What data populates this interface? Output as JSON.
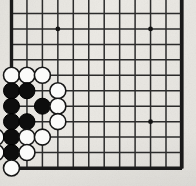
{
  "board": {
    "kind": "go-board",
    "view": "bottom-left corner crop of a 19x19 goban",
    "title": "Go board position",
    "geometry": {
      "cols": 12,
      "rows": 11,
      "origin_x": 11.5,
      "origin_y": 13.5,
      "spacing": 15.45,
      "edge_left_x": 11.5,
      "edge_bottom_y": 168.5,
      "edge_right_x": 182.0,
      "stone_radius": 8.0
    },
    "colors": {
      "paper": "#eceae5",
      "line": "#2b2b2b",
      "edge_line": "#1a1a1a",
      "black_stone": "#0d0d0d",
      "white_stone": "#fbfbfa",
      "white_stone_outline": "#161616",
      "star_point": "#141414"
    },
    "star_points": [
      {
        "col": 3,
        "row": 1
      },
      {
        "col": 9,
        "row": 1
      },
      {
        "col": 3,
        "row": 7
      },
      {
        "col": 9,
        "row": 7
      }
    ],
    "stones": [
      {
        "color": "white",
        "col": 0,
        "row": 4
      },
      {
        "color": "white",
        "col": 1,
        "row": 4
      },
      {
        "color": "white",
        "col": 2,
        "row": 4
      },
      {
        "color": "black",
        "col": 0,
        "row": 5
      },
      {
        "color": "black",
        "col": 1,
        "row": 5
      },
      {
        "color": "white",
        "col": 3,
        "row": 5
      },
      {
        "color": "black",
        "col": 0,
        "row": 6
      },
      {
        "color": "black",
        "col": 2,
        "row": 6
      },
      {
        "color": "white",
        "col": 3,
        "row": 6
      },
      {
        "color": "black",
        "col": 0,
        "row": 7
      },
      {
        "color": "black",
        "col": 1,
        "row": 7
      },
      {
        "color": "white",
        "col": 3,
        "row": 7
      },
      {
        "color": "white",
        "col": -1,
        "row": 8
      },
      {
        "color": "black",
        "col": 0,
        "row": 8
      },
      {
        "color": "white",
        "col": 1,
        "row": 8
      },
      {
        "color": "white",
        "col": 2,
        "row": 8
      },
      {
        "color": "white",
        "col": -1,
        "row": 9
      },
      {
        "color": "black",
        "col": 0,
        "row": 9
      },
      {
        "color": "white",
        "col": 1,
        "row": 9
      },
      {
        "color": "white",
        "col": 0,
        "row": 10
      }
    ],
    "counts": {
      "black_label": "Black stones",
      "black_value": "8",
      "white_label": "White stones",
      "white_value": "12"
    }
  }
}
